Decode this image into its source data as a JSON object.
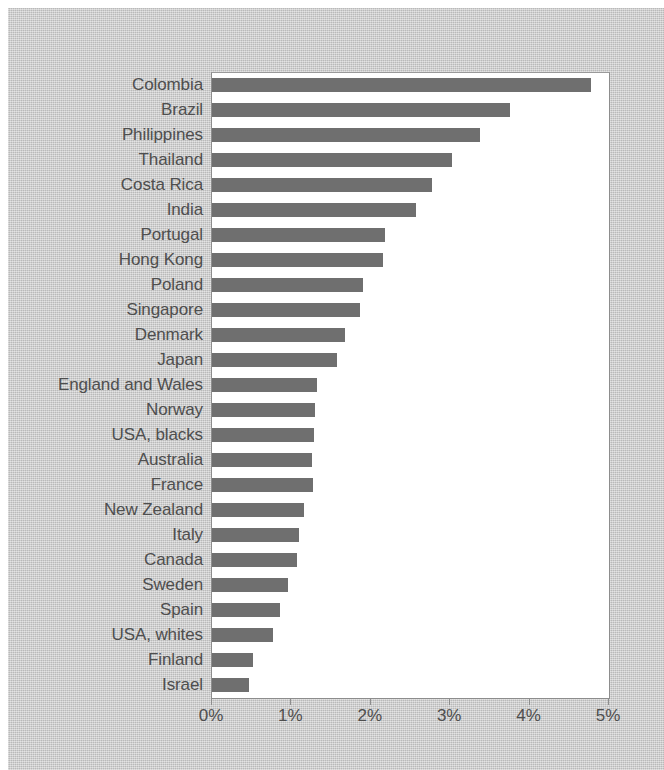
{
  "chart_data": {
    "type": "bar",
    "orientation": "horizontal",
    "title": "",
    "subtitle": "",
    "xlabel": "",
    "ylabel": "",
    "xlim": [
      0,
      5
    ],
    "xticks": [
      0,
      1,
      2,
      3,
      4,
      5
    ],
    "xtick_labels": [
      "0%",
      "1%",
      "2%",
      "3%",
      "4%",
      "5%"
    ],
    "grid": false,
    "legend": null,
    "bar_color": "#6f6f6f",
    "plot_background": "#ffffff",
    "figure_background": "#c9c9c9",
    "label_color": "#4e4e4e",
    "categories": [
      "Colombia",
      "Brazil",
      "Philippines",
      "Thailand",
      "Costa Rica",
      "India",
      "Portugal",
      "Hong Kong",
      "Poland",
      "Singapore",
      "Denmark",
      "Japan",
      "England and Wales",
      "Norway",
      "USA, blacks",
      "Australia",
      "France",
      "New Zealand",
      "Italy",
      "Canada",
      "Sweden",
      "Spain",
      "USA, whites",
      "Finland",
      "Israel"
    ],
    "values": [
      4.77,
      3.75,
      3.37,
      3.02,
      2.77,
      2.57,
      2.18,
      2.15,
      1.9,
      1.86,
      1.68,
      1.58,
      1.32,
      1.3,
      1.29,
      1.26,
      1.27,
      1.16,
      1.1,
      1.07,
      0.96,
      0.86,
      0.77,
      0.52,
      0.47
    ]
  }
}
